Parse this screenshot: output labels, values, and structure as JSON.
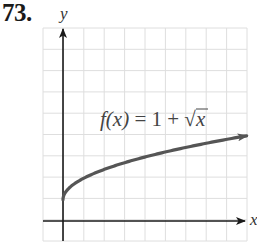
{
  "problem": {
    "number": "73."
  },
  "chart_data": {
    "type": "line",
    "title": "",
    "function_label": "f(x) = 1 + √x",
    "function_label_parts": {
      "lhs": "f(x)",
      "eq": " = 1 + ",
      "radical": "√",
      "radicand": "x"
    },
    "xlabel": "x",
    "ylabel": "y",
    "grid": true,
    "tick_labels": false,
    "xlim": [
      -1,
      9
    ],
    "ylim": [
      -1,
      9
    ],
    "series": [
      {
        "name": "f(x) = 1 + √x",
        "x": [
          0,
          0.25,
          1,
          2,
          3,
          4,
          5,
          6,
          7,
          8,
          9
        ],
        "values": [
          1,
          1.5,
          2,
          2.414,
          2.732,
          3,
          3.236,
          3.449,
          3.646,
          3.828,
          4
        ],
        "color": "#555555",
        "end_arrow": true
      }
    ],
    "colors": {
      "grid": "#dedede",
      "axis": "#1a1a1a",
      "curve": "#555555"
    }
  }
}
